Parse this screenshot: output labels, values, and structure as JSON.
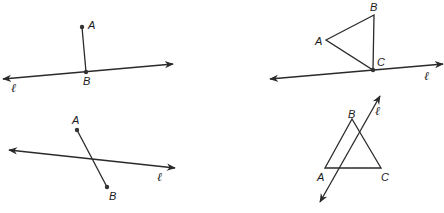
{
  "colors": {
    "stroke": "#2a2a2a",
    "point": "#333333",
    "background": "#ffffff"
  },
  "figures": [
    {
      "id": "fig1",
      "description": "Segment AB perpendicular-ish, B on line l",
      "labels": {
        "A": "A",
        "B": "B",
        "line": "ℓ"
      },
      "points": {
        "A": [
          82,
          27
        ],
        "B": [
          86,
          72
        ]
      },
      "line": {
        "from": [
          3,
          79
        ],
        "to": [
          173,
          64
        ]
      }
    },
    {
      "id": "fig2",
      "description": "Triangle ABC with vertex C on line l",
      "labels": {
        "A": "A",
        "B": "B",
        "C": "C",
        "line": "ℓ"
      },
      "points": {
        "A": [
          326,
          40
        ],
        "B": [
          374,
          15
        ],
        "C": [
          373,
          70
        ]
      },
      "line": {
        "from": [
          270,
          79
        ],
        "to": [
          443,
          64
        ]
      }
    },
    {
      "id": "fig3",
      "description": "Segment AB crossing line l",
      "labels": {
        "A": "A",
        "B": "B",
        "line": "ℓ"
      },
      "points": {
        "A": [
          77,
          130
        ],
        "B": [
          107,
          187
        ]
      },
      "line": {
        "from": [
          9,
          150
        ],
        "to": [
          175,
          168
        ]
      }
    },
    {
      "id": "fig4",
      "description": "Triangle ABC crossed by line l",
      "labels": {
        "A": "A",
        "B": "B",
        "C": "C",
        "line": "ℓ"
      },
      "points": {
        "A": [
          325,
          168
        ],
        "B": [
          352,
          119
        ],
        "C": [
          381,
          168
        ]
      },
      "line": {
        "from": [
          320,
          202
        ],
        "to": [
          380,
          96
        ]
      }
    }
  ]
}
